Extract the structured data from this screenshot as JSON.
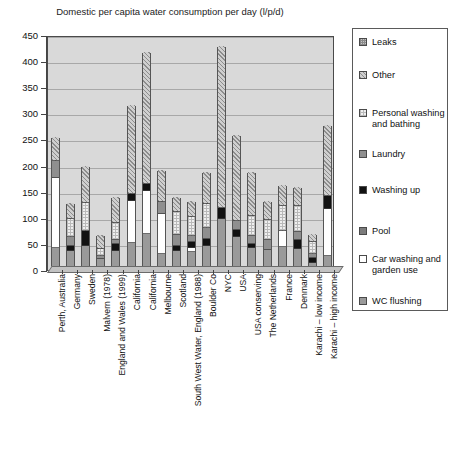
{
  "chart_data": {
    "type": "bar",
    "subtype": "stacked-vertical",
    "title": "Domestic per capita water consumption per day (l/p/d)",
    "xlabel": "",
    "ylabel": "",
    "ylim": [
      0,
      450
    ],
    "ytick_step": 50,
    "yticks": [
      450,
      400,
      350,
      300,
      250,
      200,
      150,
      100,
      50,
      0
    ],
    "grid": true,
    "legend_position": "right",
    "categories": [
      "Perth, Australia",
      "Germany",
      "Sweden",
      "Malvern (1978)",
      "England and Wales (1999)",
      "California",
      "California",
      "Melbourne",
      "Scotland",
      "South West Water, England (1988)",
      "Boulder Co",
      "NYC",
      "USA",
      "USA conserving",
      "The Netherlands",
      "France",
      "Denmark",
      "Karachi – low income",
      "Karachi – high income"
    ],
    "series": [
      {
        "name": "WC flushing",
        "key": "wc",
        "swatch": "p-wc",
        "values": [
          40,
          35,
          45,
          20,
          35,
          50,
          68,
          28,
          35,
          33,
          45,
          95,
          62,
          40,
          37,
          42,
          38,
          12,
          25
        ]
      },
      {
        "name": "Car washing and garden use",
        "key": "car",
        "swatch": "p-car",
        "values": [
          135,
          0,
          0,
          0,
          0,
          80,
          82,
          78,
          0,
          8,
          0,
          0,
          0,
          0,
          0,
          30,
          0,
          0,
          90
        ]
      },
      {
        "name": "Pool",
        "key": "pool",
        "swatch": "p-pool",
        "values": [
          0,
          0,
          0,
          0,
          0,
          0,
          0,
          0,
          0,
          0,
          0,
          0,
          0,
          0,
          0,
          0,
          0,
          0,
          0
        ]
      },
      {
        "name": "Washing up",
        "key": "washup",
        "swatch": "p-wash",
        "values": [
          0,
          9,
          27,
          0,
          12,
          13,
          12,
          0,
          10,
          10,
          12,
          22,
          12,
          8,
          0,
          0,
          18,
          9,
          25
        ]
      },
      {
        "name": "Laundry",
        "key": "laundry",
        "swatch": "p-laundry",
        "values": [
          32,
          17,
          0,
          5,
          8,
          0,
          0,
          22,
          20,
          13,
          22,
          0,
          18,
          16,
          18,
          0,
          14,
          8,
          0
        ]
      },
      {
        "name": "Personal washing and bathing",
        "key": "personal",
        "swatch": "p-personal",
        "values": [
          0,
          35,
          55,
          14,
          34,
          0,
          0,
          0,
          45,
          35,
          45,
          0,
          0,
          38,
          38,
          48,
          50,
          22,
          0
        ]
      },
      {
        "name": "Other",
        "key": "other",
        "swatch": "p-other",
        "values": [
          46,
          31,
          70,
          26,
          48,
          172,
          253,
          62,
          28,
          31,
          61,
          311,
          165,
          83,
          37,
          40,
          38,
          16,
          135
        ]
      },
      {
        "name": "Leaks",
        "key": "leaks",
        "swatch": "p-leaks",
        "values": [
          0,
          0,
          0,
          0,
          0,
          0,
          0,
          0,
          0,
          0,
          0,
          0,
          0,
          0,
          0,
          0,
          0,
          0,
          0
        ]
      }
    ],
    "totals": [
      253,
      127,
      197,
      65,
      137,
      315,
      415,
      190,
      138,
      130,
      185,
      428,
      257,
      185,
      130,
      160,
      158,
      67,
      275
    ]
  },
  "legend": {
    "items": [
      {
        "label": "Leaks",
        "swatch": "p-leaks",
        "top": 8
      },
      {
        "label": "Other",
        "swatch": "p-other",
        "top": 41
      },
      {
        "label": "Personal washing and bathing",
        "swatch": "p-personal",
        "top": 79
      },
      {
        "label": "Laundry",
        "swatch": "p-laundry",
        "top": 120
      },
      {
        "label": "Washing up",
        "swatch": "p-wash",
        "top": 156
      },
      {
        "label": "Pool",
        "swatch": "p-pool",
        "top": 197
      },
      {
        "label": "Car washing and garden use",
        "swatch": "p-car",
        "top": 225
      },
      {
        "label": "WC flushing",
        "swatch": "p-wc",
        "top": 267
      }
    ]
  }
}
